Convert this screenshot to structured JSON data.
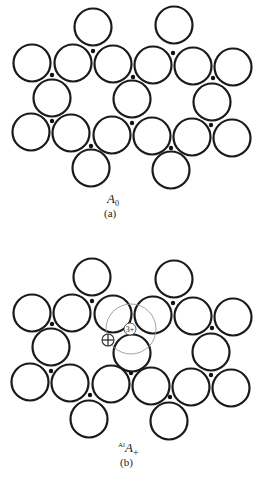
{
  "figure": {
    "panels": [
      {
        "id": "a",
        "label": "(a)",
        "symbol": "A",
        "symbol_sub": "0",
        "symbol_sup": "",
        "atom_radius": 18.5,
        "atoms": [
          [
            93,
            27
          ],
          [
            174,
            25
          ],
          [
            32,
            63
          ],
          [
            73,
            63
          ],
          [
            113,
            64
          ],
          [
            153,
            65
          ],
          [
            193,
            66
          ],
          [
            233,
            67
          ],
          [
            52,
            98
          ],
          [
            132,
            99
          ],
          [
            212,
            102
          ],
          [
            31,
            132
          ],
          [
            71,
            133
          ],
          [
            112,
            135
          ],
          [
            152,
            136
          ],
          [
            192,
            137
          ],
          [
            232,
            138
          ],
          [
            91,
            168
          ],
          [
            171,
            170
          ]
        ],
        "sites": [
          [
            93,
            51
          ],
          [
            173,
            53
          ],
          [
            52,
            75
          ],
          [
            133,
            77
          ],
          [
            213,
            78
          ],
          [
            52,
            121
          ],
          [
            132,
            123
          ],
          [
            211,
            125
          ],
          [
            91,
            146
          ],
          [
            171,
            148
          ]
        ]
      },
      {
        "id": "b",
        "label": "(b)",
        "symbol": "A",
        "symbol_sub": "+",
        "symbol_sup": "Al",
        "atom_radius": 18.5,
        "atoms": [
          [
            92,
            277
          ],
          [
            174,
            279
          ],
          [
            32,
            313
          ],
          [
            72,
            313
          ],
          [
            113,
            314
          ],
          [
            153,
            315
          ],
          [
            193,
            316
          ],
          [
            233,
            317
          ],
          [
            51,
            347
          ],
          [
            132,
            353
          ],
          [
            211,
            352
          ],
          [
            30,
            382
          ],
          [
            70,
            383
          ],
          [
            111,
            384
          ],
          [
            151,
            386
          ],
          [
            191,
            387
          ],
          [
            231,
            388
          ],
          [
            89,
            419
          ],
          [
            169,
            421
          ]
        ],
        "sites": [
          [
            92,
            301
          ],
          [
            173,
            303
          ],
          [
            52,
            324
          ],
          [
            212,
            328
          ],
          [
            51,
            371
          ],
          [
            131,
            373
          ],
          [
            211,
            375
          ],
          [
            90,
            395
          ],
          [
            170,
            397
          ]
        ],
        "defect": {
          "halo": {
            "cx": 131,
            "cy": 329,
            "r": 25
          },
          "ion": {
            "cx": 130,
            "cy": 329,
            "r": 6,
            "text": "3+"
          },
          "vacancy": {
            "cx": 108,
            "cy": 340,
            "r": 6
          }
        }
      }
    ]
  }
}
